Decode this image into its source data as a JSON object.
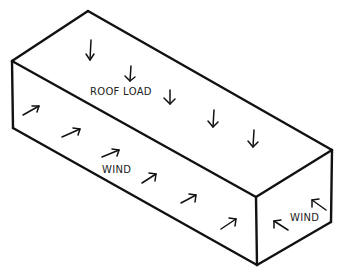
{
  "diagram": {
    "clipped_caption": "",
    "labels": {
      "roof": "ROOF LOAD",
      "wind_side": "WIND",
      "wind_end": "WIND"
    },
    "stroke_color": "#111111",
    "background": "#ffffff"
  }
}
